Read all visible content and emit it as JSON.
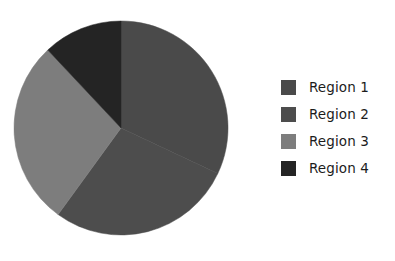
{
  "chart_data": {
    "type": "pie",
    "title": "",
    "subtitle": "",
    "xlabel": "",
    "ylabel": "",
    "grid": false,
    "legend_position": "right",
    "start_angle_deg": 0,
    "direction": "clockwise",
    "categories": [
      "Region 1",
      "Region 2",
      "Region 3",
      "Region 4"
    ],
    "values": [
      32,
      28,
      28,
      12
    ],
    "units": "percent",
    "slices": [
      {
        "label": "Region 1",
        "value": 32,
        "percent": 32,
        "color": "#4a4a4a",
        "start_deg": 0,
        "end_deg": 115.2
      },
      {
        "label": "Region 2",
        "value": 28,
        "percent": 28,
        "color": "#4d4d4d",
        "start_deg": 115.2,
        "end_deg": 216.0
      },
      {
        "label": "Region 3",
        "value": 28,
        "percent": 28,
        "color": "#7d7d7d",
        "start_deg": 244.8,
        "end_deg": 360.0
      },
      {
        "label": "Region 4",
        "value": 12,
        "percent": 12,
        "color": "#242424",
        "start_deg": 216.0,
        "end_deg": 244.8
      }
    ],
    "annotations": []
  },
  "figure": {
    "background_color": "#ffffff",
    "pie": {
      "center_x": 121,
      "center_y": 128,
      "radius": 107
    }
  },
  "legend": {
    "items": [
      {
        "label": "Region 1",
        "color": "#4a4a4a"
      },
      {
        "label": "Region 2",
        "color": "#4d4d4d"
      },
      {
        "label": "Region 3",
        "color": "#7d7d7d"
      },
      {
        "label": "Region 4",
        "color": "#242424"
      }
    ]
  }
}
